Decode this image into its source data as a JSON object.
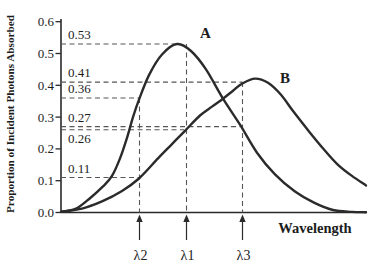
{
  "figure": {
    "ylabel": "Proportion of Incident Photons Absorbed",
    "xlabel": "Wavelength",
    "series_labels": {
      "a": "A",
      "b": "B"
    },
    "colors": {
      "ink": "#2a2a2a",
      "curve": "#2b2b2b",
      "dashed": "#565656",
      "background": "#ffffff"
    }
  },
  "chart_data": {
    "type": "line",
    "title": "",
    "xlabel": "Wavelength",
    "ylabel": "Proportion of Incident Photons Absorbed",
    "ylim": [
      0.0,
      0.6
    ],
    "yticks": [
      0.6,
      0.5,
      0.4,
      0.3,
      0.2,
      0.1,
      0.0
    ],
    "x_axis": {
      "numeric": false,
      "markers": [
        {
          "label": "λ2",
          "x": 139.5
        },
        {
          "label": "λ1",
          "x": 186.5
        },
        {
          "label": "λ3",
          "x": 242.5
        }
      ]
    },
    "guides": {
      "horizontal": [
        {
          "label": "0.53",
          "value": 0.53,
          "x_end": 177,
          "label_side": "above"
        },
        {
          "label": "0.41",
          "value": 0.41,
          "x_end": 242.5,
          "label_side": "above"
        },
        {
          "label": "0.36",
          "value": 0.36,
          "x_end": 139.5,
          "label_side": "above"
        },
        {
          "label": "0.27",
          "value": 0.27,
          "x_end": 240,
          "label_side": "above"
        },
        {
          "label": "0.26",
          "value": 0.26,
          "x_end": 184,
          "label_side": "below"
        },
        {
          "label": "0.11",
          "value": 0.11,
          "x_end": 139.5,
          "label_side": "above"
        }
      ],
      "vertical": [
        {
          "x": 139.5,
          "top_value": 0.36
        },
        {
          "x": 186.5,
          "top_value": 0.53
        },
        {
          "x": 242.5,
          "top_value": 0.41
        }
      ]
    },
    "series": [
      {
        "name": "A",
        "points": [
          [
            61,
            0.002
          ],
          [
            76,
            0.012
          ],
          [
            90,
            0.045
          ],
          [
            103,
            0.082
          ],
          [
            112,
            0.115
          ],
          [
            120,
            0.17
          ],
          [
            127,
            0.235
          ],
          [
            133,
            0.3
          ],
          [
            139,
            0.355
          ],
          [
            149,
            0.432
          ],
          [
            162,
            0.497
          ],
          [
            177,
            0.53
          ],
          [
            191,
            0.508
          ],
          [
            206,
            0.45
          ],
          [
            223,
            0.358
          ],
          [
            240,
            0.276
          ],
          [
            257,
            0.188
          ],
          [
            275,
            0.12
          ],
          [
            295,
            0.066
          ],
          [
            314,
            0.031
          ],
          [
            333,
            0.008
          ],
          [
            352,
            0.002
          ],
          [
            366,
            0.001
          ]
        ]
      },
      {
        "name": "B",
        "points": [
          [
            61,
            0.002
          ],
          [
            82,
            0.012
          ],
          [
            102,
            0.035
          ],
          [
            122,
            0.068
          ],
          [
            139,
            0.107
          ],
          [
            158,
            0.17
          ],
          [
            172,
            0.215
          ],
          [
            185,
            0.257
          ],
          [
            200,
            0.305
          ],
          [
            212,
            0.333
          ],
          [
            223,
            0.358
          ],
          [
            233,
            0.383
          ],
          [
            242,
            0.405
          ],
          [
            255,
            0.421
          ],
          [
            268,
            0.408
          ],
          [
            281,
            0.37
          ],
          [
            294,
            0.315
          ],
          [
            309,
            0.255
          ],
          [
            324,
            0.198
          ],
          [
            338,
            0.15
          ],
          [
            352,
            0.115
          ],
          [
            366,
            0.085
          ]
        ]
      }
    ]
  }
}
